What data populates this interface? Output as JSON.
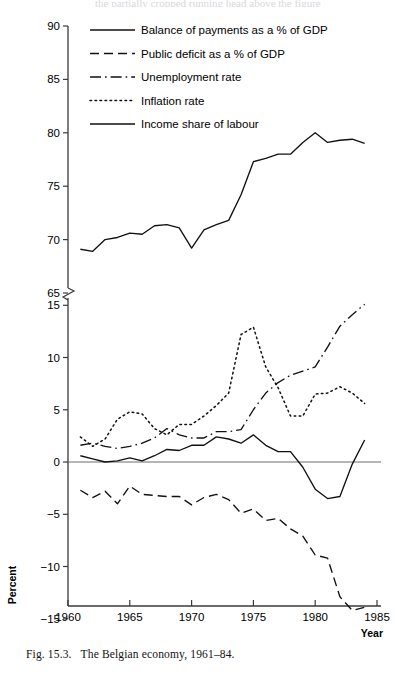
{
  "figure": {
    "caption_number": "Fig. 15.3.",
    "caption_text": "The Belgian economy, 1961–84.",
    "top_cut_text": "the partially cropped running head above the figure"
  },
  "chart_data": {
    "type": "line",
    "title": "",
    "subtitle": "",
    "xlabel": "Year",
    "ylabel": "Percent",
    "grid": false,
    "legend_position": "top-left-inside",
    "axis_note": "Broken y-axis: upper panel 65–90 (income share of labour), lower panel −15 to 15 (rates)",
    "x": [
      1961,
      1962,
      1963,
      1964,
      1965,
      1966,
      1967,
      1968,
      1969,
      1970,
      1971,
      1972,
      1973,
      1974,
      1975,
      1976,
      1977,
      1978,
      1979,
      1980,
      1981,
      1982,
      1983,
      1984
    ],
    "xticks": [
      "1960",
      "1965",
      "1970",
      "1975",
      "1980",
      "1985"
    ],
    "xlim": [
      1960,
      1985
    ],
    "upper_axis": {
      "ylim": [
        65,
        90
      ],
      "yticks": [
        "65",
        "70",
        "75",
        "80",
        "85",
        "90"
      ]
    },
    "lower_axis": {
      "ylim": [
        -15,
        15
      ],
      "yticks": [
        "-15",
        "-10",
        "-5",
        "0",
        "5",
        "10",
        "15"
      ]
    },
    "series": [
      {
        "name": "Balance of payments as a % of GDP",
        "legend_label": "Balance of payments as a % of GDP",
        "dash": "solid",
        "axis": "lower",
        "values": [
          0.6,
          0.3,
          0.0,
          0.1,
          0.4,
          0.1,
          0.6,
          1.2,
          1.1,
          1.6,
          1.6,
          2.4,
          2.2,
          1.8,
          2.6,
          1.6,
          1.0,
          1.0,
          -0.5,
          -2.6,
          -3.5,
          -3.3,
          -0.2,
          2.1
        ]
      },
      {
        "name": "Public deficit as a % of GDP",
        "legend_label": "Public deficit as a % of GDP",
        "dash": "dashed",
        "axis": "lower",
        "values": [
          -2.7,
          -3.4,
          -2.8,
          -4.0,
          -2.3,
          -3.1,
          -3.2,
          -3.3,
          -3.3,
          -4.1,
          -3.4,
          -3.1,
          -3.6,
          -4.9,
          -4.5,
          -5.6,
          -5.4,
          -6.4,
          -7.1,
          -8.9,
          -9.2,
          -12.9,
          -14.2,
          -13.9
        ]
      },
      {
        "name": "Unemployment rate",
        "dash": "dashdot",
        "legend_label": "Unemployment rate",
        "axis": "lower",
        "values": [
          1.6,
          1.8,
          1.5,
          1.3,
          1.5,
          1.8,
          2.3,
          3.2,
          2.6,
          2.3,
          2.3,
          2.9,
          2.9,
          3.1,
          5.0,
          6.6,
          7.6,
          8.3,
          8.7,
          9.1,
          11.0,
          13.0,
          14.1,
          15.1
        ]
      },
      {
        "name": "Inflation rate",
        "dash": "dotted",
        "legend_label": "Inflation rate",
        "axis": "lower",
        "values": [
          2.4,
          1.5,
          2.2,
          4.1,
          4.8,
          4.6,
          3.2,
          2.6,
          3.6,
          3.6,
          4.4,
          5.4,
          6.6,
          12.2,
          12.9,
          9.1,
          7.1,
          4.4,
          4.4,
          6.5,
          6.6,
          7.2,
          6.6,
          5.6
        ]
      },
      {
        "name": "Income share of labour",
        "dash": "solid",
        "legend_label": "Income share of labour",
        "axis": "upper",
        "values": [
          69.1,
          68.9,
          70.0,
          70.2,
          70.6,
          70.5,
          71.3,
          71.4,
          71.1,
          69.2,
          70.9,
          71.4,
          71.8,
          74.2,
          77.3,
          77.6,
          78.0,
          78.0,
          79.1,
          80.0,
          79.1,
          79.3,
          79.4,
          79.0
        ]
      }
    ]
  },
  "legend": {
    "items": [
      {
        "label": "Balance of payments as a % of GDP",
        "dash": "solid"
      },
      {
        "label": "Public deficit as a % of GDP",
        "dash": "dashed"
      },
      {
        "label": "Unemployment rate",
        "dash": "dashdot"
      },
      {
        "label": "Inflation rate",
        "dash": "dotted"
      },
      {
        "label": "Income share of labour",
        "dash": "solid"
      }
    ]
  }
}
